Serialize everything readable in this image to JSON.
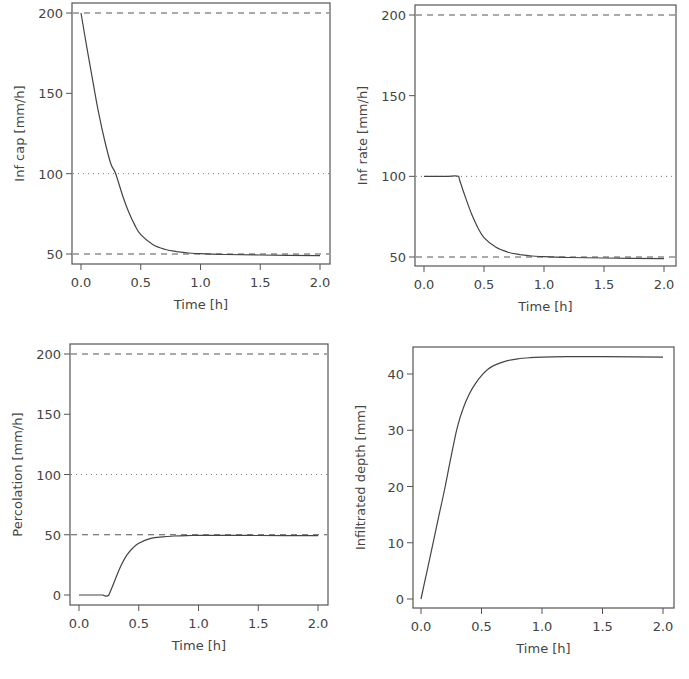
{
  "chart_data": [
    {
      "type": "line",
      "id": "inf-cap",
      "title": "",
      "xlabel": "Time [h]",
      "ylabel": "Inf cap [mm/h]",
      "xlim": [
        -0.05,
        2.05
      ],
      "ylim": [
        45,
        205
      ],
      "xticks": [
        0.0,
        0.5,
        1.0,
        1.5,
        2.0
      ],
      "xtick_labels": [
        "0.0",
        "0.5",
        "1.0",
        "1.5",
        "2.0"
      ],
      "yticks": [
        50,
        100,
        150,
        200
      ],
      "ytick_labels": [
        "50",
        "100",
        "150",
        "200"
      ],
      "grid": false,
      "frame": {
        "left": 72,
        "top": 3,
        "right": 330,
        "bottom": 264
      },
      "axis_map": {
        "x0": 0.0,
        "px_x0": 81,
        "x1": 2.0,
        "px_x1": 320,
        "y0": 50,
        "px_y0": 254,
        "y1": 200,
        "px_y1": 13
      },
      "reference_lines": [
        {
          "y": 200,
          "style": "dashed"
        },
        {
          "y": 100,
          "style": "dotted"
        },
        {
          "y": 50,
          "style": "dashed"
        }
      ],
      "series": [
        {
          "name": "Infiltration capacity",
          "x": [
            0.0,
            0.05,
            0.1,
            0.15,
            0.2,
            0.25,
            0.29,
            0.35,
            0.4,
            0.45,
            0.5,
            0.6,
            0.7,
            0.8,
            0.9,
            1.0,
            1.2,
            1.5,
            2.0
          ],
          "y": [
            200,
            178,
            157,
            137,
            120,
            106,
            100,
            86,
            76,
            68,
            62,
            56,
            53,
            51.5,
            50.6,
            50.2,
            49.7,
            49.4,
            49
          ]
        }
      ]
    },
    {
      "type": "line",
      "id": "inf-rate",
      "title": "",
      "xlabel": "Time [h]",
      "ylabel": "Inf rate [mm/h]",
      "xlim": [
        -0.05,
        2.05
      ],
      "ylim": [
        45,
        205
      ],
      "xticks": [
        0.0,
        0.5,
        1.0,
        1.5,
        2.0
      ],
      "xtick_labels": [
        "0.0",
        "0.5",
        "1.0",
        "1.5",
        "2.0"
      ],
      "yticks": [
        50,
        100,
        150,
        200
      ],
      "ytick_labels": [
        "50",
        "100",
        "150",
        "200"
      ],
      "grid": false,
      "frame": {
        "left": 415,
        "top": 5,
        "right": 676,
        "bottom": 266
      },
      "axis_map": {
        "x0": 0.0,
        "px_x0": 424,
        "x1": 2.0,
        "px_x1": 664,
        "y0": 50,
        "px_y0": 257,
        "y1": 200,
        "px_y1": 15
      },
      "reference_lines": [
        {
          "y": 200,
          "style": "dashed"
        },
        {
          "y": 100,
          "style": "dotted"
        },
        {
          "y": 50,
          "style": "dashed"
        }
      ],
      "series": [
        {
          "name": "Infiltration rate",
          "x": [
            0.0,
            0.1,
            0.2,
            0.29,
            0.3,
            0.35,
            0.4,
            0.45,
            0.5,
            0.6,
            0.7,
            0.8,
            0.9,
            1.0,
            1.2,
            1.5,
            2.0
          ],
          "y": [
            100,
            100,
            100,
            100,
            97,
            86,
            76,
            68,
            62,
            56,
            53,
            51.5,
            50.6,
            50.2,
            49.7,
            49.4,
            49
          ]
        }
      ]
    },
    {
      "type": "line",
      "id": "percolation",
      "title": "",
      "xlabel": "Time [h]",
      "ylabel": "Percolation [mm/h]",
      "xlim": [
        -0.05,
        2.05
      ],
      "ylim": [
        -8,
        208
      ],
      "xticks": [
        0.0,
        0.5,
        1.0,
        1.5,
        2.0
      ],
      "xtick_labels": [
        "0.0",
        "0.5",
        "1.0",
        "1.5",
        "2.0"
      ],
      "yticks": [
        0,
        50,
        100,
        150,
        200
      ],
      "ytick_labels": [
        "0",
        "50",
        "100",
        "150",
        "200"
      ],
      "grid": false,
      "frame": {
        "left": 70,
        "top": 344,
        "right": 328,
        "bottom": 605
      },
      "axis_map": {
        "x0": 0.0,
        "px_x0": 79,
        "x1": 2.0,
        "px_x1": 318,
        "y0": 0,
        "px_y0": 595,
        "y1": 200,
        "px_y1": 354
      },
      "reference_lines": [
        {
          "y": 200,
          "style": "dashed"
        },
        {
          "y": 100,
          "style": "dotted"
        },
        {
          "y": 50,
          "style": "dashed"
        }
      ],
      "series": [
        {
          "name": "Percolation",
          "x": [
            0.0,
            0.1,
            0.2,
            0.25,
            0.3,
            0.35,
            0.4,
            0.45,
            0.5,
            0.6,
            0.7,
            0.8,
            0.9,
            1.0,
            1.2,
            1.5,
            2.0
          ],
          "y": [
            0,
            0,
            0,
            0,
            12,
            24,
            33,
            39,
            43,
            47,
            48.3,
            49,
            49.3,
            49.5,
            49.5,
            49.4,
            49.3
          ]
        }
      ]
    },
    {
      "type": "line",
      "id": "infiltrated-depth",
      "title": "",
      "xlabel": "Time [h]",
      "ylabel": "Infiltrated depth [mm]",
      "xlim": [
        -0.05,
        2.05
      ],
      "ylim": [
        -2,
        45.5
      ],
      "xticks": [
        0.0,
        0.5,
        1.0,
        1.5,
        2.0
      ],
      "xtick_labels": [
        "0.0",
        "0.5",
        "1.0",
        "1.5",
        "2.0"
      ],
      "yticks": [
        0,
        10,
        20,
        30,
        40
      ],
      "ytick_labels": [
        "0",
        "10",
        "20",
        "30",
        "40"
      ],
      "grid": false,
      "frame": {
        "left": 413,
        "top": 347,
        "right": 674,
        "bottom": 608
      },
      "axis_map": {
        "x0": 0.0,
        "px_x0": 421,
        "x1": 2.0,
        "px_x1": 663,
        "y0": 0,
        "px_y0": 599,
        "y1": 40,
        "px_y1": 374
      },
      "reference_lines": [],
      "series": [
        {
          "name": "Infiltrated depth",
          "x": [
            0.0,
            0.05,
            0.1,
            0.15,
            0.2,
            0.25,
            0.3,
            0.35,
            0.4,
            0.45,
            0.5,
            0.55,
            0.6,
            0.7,
            0.8,
            0.9,
            1.0,
            1.2,
            1.5,
            2.0
          ],
          "y": [
            0,
            5,
            10,
            15,
            20,
            25.5,
            30.5,
            34,
            36.5,
            38.3,
            39.7,
            40.8,
            41.5,
            42.3,
            42.7,
            42.9,
            43,
            43.1,
            43.1,
            43
          ]
        }
      ]
    }
  ]
}
